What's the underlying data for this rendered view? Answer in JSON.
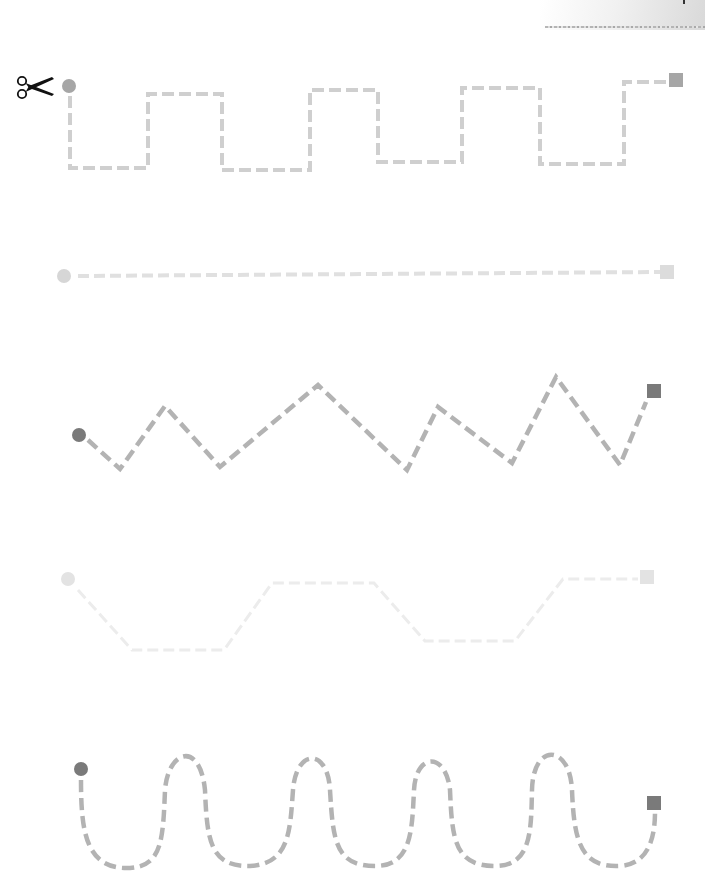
{
  "worksheet": {
    "type": "scissor cutting / line tracing practice",
    "scissors_icon": "scissors-icon",
    "corner_decoration": "torn-paper-corner",
    "colors": {
      "dashed_line_dark": "#b3b3b3",
      "dashed_line_light": "#dcdcdc",
      "dashed_line_faint": "#ececec",
      "marker_dark": "#7a7a7a",
      "marker_medium": "#a6a6a6",
      "marker_light": "#d6d6d6",
      "marker_faint": "#e3e3e3"
    },
    "paths": [
      {
        "name": "square-wave",
        "start": {
          "shape": "circle",
          "x": 69,
          "y": 86
        },
        "end": {
          "shape": "square",
          "x": 676,
          "y": 80
        },
        "points": "70,96 70,168 148,168 148,94 222,94 222,170 310,170 310,90 378,90 378,162 462,162 462,88 540,88 540,164 624,164 624,82 668,82"
      },
      {
        "name": "straight-line",
        "start": {
          "shape": "circle",
          "x": 64,
          "y": 276
        },
        "end": {
          "shape": "square",
          "x": 667,
          "y": 272
        },
        "points": "78,276 660,272"
      },
      {
        "name": "zigzag",
        "start": {
          "shape": "circle",
          "x": 79,
          "y": 435
        },
        "end": {
          "shape": "square",
          "x": 654,
          "y": 391
        },
        "points": "88,440 120,469 165,406 220,467 318,385 407,470 438,407 512,463 556,377 620,465 646,402"
      },
      {
        "name": "trapezoid-wave",
        "start": {
          "shape": "circle",
          "x": 68,
          "y": 579
        },
        "end": {
          "shape": "square",
          "x": 647,
          "y": 577
        },
        "points": "78,590 132,650 224,650 272,583 374,583 425,641 515,641 563,579 638,579"
      },
      {
        "name": "curvy-wave",
        "start": {
          "shape": "circle",
          "x": 81,
          "y": 769
        },
        "end": {
          "shape": "square",
          "x": 654,
          "y": 803
        },
        "path": "M 81 780 C 81 830, 85 870, 130 868 C 162 866, 163 840, 165 790 C 168 750, 200 740, 205 790 C 207 840, 210 867, 250 866 C 290 864, 290 830, 293 790 C 296 748, 328 748, 330 790 C 333 840, 335 866, 375 866 C 412 866, 412 830, 414 790 C 416 752, 446 752, 450 790 C 452 840, 455 866, 495 866 C 532 866, 531 830, 532 790 C 533 742, 570 744, 572 790 C 574 840, 580 868, 620 866 C 650 864, 655 835, 655 812"
      }
    ]
  }
}
